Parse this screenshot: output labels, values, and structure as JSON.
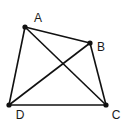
{
  "diagram": {
    "type": "quadrilateral-with-diagonals",
    "stroke_color": "#111111",
    "points": [
      {
        "id": "A",
        "label": "A",
        "x": 25,
        "y": 27,
        "label_x": 38,
        "label_y": 22
      },
      {
        "id": "B",
        "label": "B",
        "x": 90,
        "y": 43,
        "label_x": 101,
        "label_y": 51
      },
      {
        "id": "C",
        "label": "C",
        "x": 106,
        "y": 105,
        "label_x": 116,
        "label_y": 119
      },
      {
        "id": "D",
        "label": "D",
        "x": 9,
        "y": 105,
        "label_x": 20,
        "label_y": 119
      }
    ],
    "segments": [
      {
        "from": "A",
        "to": "B"
      },
      {
        "from": "B",
        "to": "C"
      },
      {
        "from": "C",
        "to": "D"
      },
      {
        "from": "D",
        "to": "A"
      },
      {
        "from": "A",
        "to": "C"
      },
      {
        "from": "B",
        "to": "D"
      }
    ]
  }
}
